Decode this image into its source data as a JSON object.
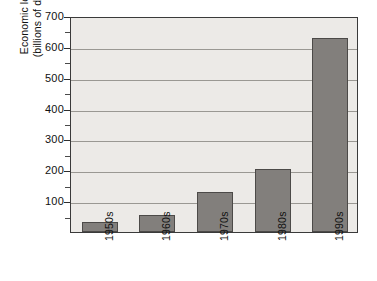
{
  "chart_data": {
    "type": "bar",
    "title": "",
    "xlabel": "",
    "ylabel": "Economic losses (billions of dollars)",
    "ylabel_line1": "Economic losses",
    "ylabel_line2": "(billions of dollars)",
    "categories": [
      "1950s",
      "1960s",
      "1970s",
      "1980s",
      "1990s"
    ],
    "values": [
      33,
      55,
      130,
      205,
      630
    ],
    "ylim": [
      0,
      700
    ],
    "ytick_values": [
      100,
      200,
      300,
      400,
      500,
      600,
      700
    ],
    "ytick_labels": [
      "100",
      "200",
      "300",
      "400",
      "500",
      "600",
      "700"
    ],
    "yminor_values": [
      50,
      150,
      250,
      350,
      450,
      550,
      650
    ],
    "grid": true,
    "legend": null,
    "series": [
      {
        "name": "Economic losses",
        "values": [
          33,
          55,
          130,
          205,
          630
        ]
      }
    ],
    "colors": {
      "bar_fill": "#827f7c",
      "bar_edge": "#4c4a48",
      "plot_background": "#eceae7",
      "gridline": "#9a9893",
      "axis": "#3a3a3a",
      "text": "#111111",
      "page_background": "#ffffff"
    }
  }
}
